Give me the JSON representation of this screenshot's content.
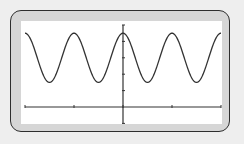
{
  "chart_data": {
    "type": "line",
    "title": "",
    "xlabel": "",
    "ylabel": "",
    "function": "y = 3 + 1.5*cos(2x)",
    "xlim": [
      -6.2832,
      6.2832
    ],
    "ylim": [
      -1,
      5
    ],
    "x_tick_step": 3.1416,
    "y_tick_step": 1,
    "x_ticks": [
      -6.2832,
      -3.1416,
      0,
      3.1416,
      6.2832
    ],
    "y_ticks": [
      -1,
      1,
      2,
      3,
      4,
      5
    ],
    "grid": false,
    "legend": null,
    "series": [
      {
        "name": "curve",
        "x": [
          -6.2832,
          -4.7124,
          -3.1416,
          -1.5708,
          0,
          1.5708,
          3.1416,
          4.7124,
          6.2832
        ],
        "values": [
          4.5,
          1.5,
          4.5,
          1.5,
          4.5,
          1.5,
          4.5,
          1.5,
          4.5
        ]
      }
    ],
    "colors": {
      "curve": "#333333",
      "axes": "#333333",
      "screen": "#ffffff",
      "bezel": "#d6d6d6",
      "background": "#eeeeee"
    }
  },
  "screen_px": {
    "left": 21,
    "top": 21,
    "width": 201,
    "height": 103,
    "x_origin_px": 123,
    "y_axis_px": 107,
    "x_left_px": 25,
    "x_right_px": 221,
    "px_per_y_unit": 16.4
  }
}
